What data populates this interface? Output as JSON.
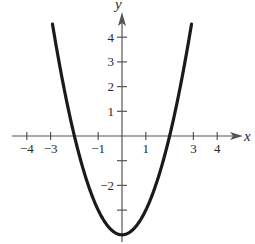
{
  "chart_data": {
    "type": "line",
    "title": "",
    "xlabel": "x",
    "ylabel": "y",
    "function": "y = x^2 - 4",
    "xlim": [
      -4.2,
      5
    ],
    "ylim": [
      -4,
      5
    ],
    "grid": false,
    "x_ticks": [
      -4,
      -3,
      -2,
      -1,
      1,
      2,
      3,
      4
    ],
    "x_tick_labels": [
      {
        "value": -4,
        "label": "−4"
      },
      {
        "value": -3,
        "label": "−3"
      },
      {
        "value": -1,
        "label": "−1"
      },
      {
        "value": 1,
        "label": "1"
      },
      {
        "value": 3,
        "label": "3"
      },
      {
        "value": 4,
        "label": "4"
      }
    ],
    "y_ticks": [
      -3,
      -2,
      -1,
      1,
      2,
      3,
      4
    ],
    "y_tick_labels": [
      {
        "value": 4,
        "label": "4"
      },
      {
        "value": 3,
        "label": "3"
      },
      {
        "value": 2,
        "label": "2"
      },
      {
        "value": 1,
        "label": "1"
      },
      {
        "value": -2,
        "label": "−2"
      }
    ],
    "series": [
      {
        "name": "parabola",
        "x": [
          -2.9,
          -2.5,
          -2,
          -1.5,
          -1,
          -0.5,
          0,
          0.5,
          1,
          1.5,
          2,
          2.5,
          2.9
        ],
        "y": [
          4.41,
          2.25,
          0,
          -1.75,
          -3,
          -3.75,
          -4,
          -3.75,
          -3,
          -1.75,
          0,
          2.25,
          4.41
        ]
      }
    ],
    "colors": {
      "axis": "#555555",
      "curve": "#1a1a1a",
      "text": "#2a2a2a"
    }
  }
}
